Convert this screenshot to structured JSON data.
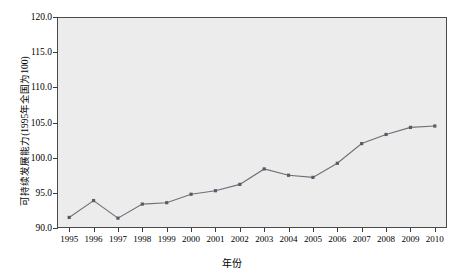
{
  "chart_data": {
    "type": "line",
    "title": "",
    "xlabel": "年份",
    "ylabel": "可持续发展能力(1995年全国为100)",
    "categories": [
      "1995",
      "1996",
      "1997",
      "1998",
      "1999",
      "2000",
      "2001",
      "2002",
      "2003",
      "2004",
      "2005",
      "2006",
      "2007",
      "2008",
      "2009",
      "2010"
    ],
    "values": [
      91.5,
      93.9,
      91.4,
      93.4,
      93.6,
      94.8,
      95.3,
      96.2,
      98.4,
      97.5,
      97.2,
      99.2,
      102.0,
      103.3,
      104.3,
      104.5
    ],
    "series": [
      {
        "name": "可持续发展能力",
        "values": [
          91.5,
          93.9,
          91.4,
          93.4,
          93.6,
          94.8,
          95.3,
          96.2,
          98.4,
          97.5,
          97.2,
          99.2,
          102.0,
          103.3,
          104.3,
          104.5
        ]
      }
    ],
    "ylim": [
      90.0,
      120.0
    ],
    "yticks": [
      90.0,
      95.0,
      100.0,
      105.0,
      110.0,
      115.0,
      120.0
    ],
    "ytick_labels": [
      "90.0",
      "95.0",
      "100.0",
      "105.0",
      "110.0",
      "115.0",
      "120.0"
    ],
    "xticks": [
      "1995",
      "1996",
      "1997",
      "1998",
      "1999",
      "2000",
      "2001",
      "2002",
      "2003",
      "2004",
      "2005",
      "2006",
      "2007",
      "2008",
      "2009",
      "2010"
    ],
    "grid": false,
    "legend": null,
    "legend_position": "none",
    "marker": "square",
    "line_color": "#6e6e78",
    "marker_color": "#5a5a66",
    "plot_background": "#ececed",
    "axis_color": "#4a4a4a"
  }
}
